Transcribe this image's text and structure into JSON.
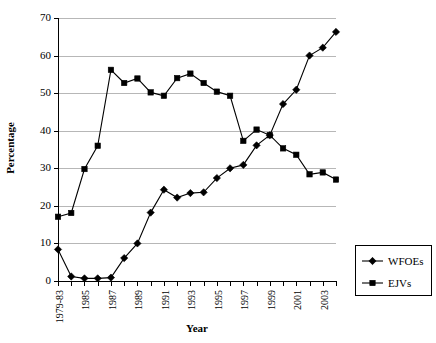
{
  "chart_data": {
    "type": "line",
    "title": "",
    "xlabel": "Year",
    "ylabel": "Percentage",
    "ylim": [
      0,
      70
    ],
    "ytick_step": 10,
    "yticks": [
      0,
      10,
      20,
      30,
      40,
      50,
      60,
      70
    ],
    "grid": true,
    "legend_position": "right",
    "x": [
      "1979-83",
      "1984",
      "1985",
      "1986",
      "1987",
      "1988",
      "1989",
      "1990",
      "1991",
      "1992",
      "1993",
      "1994",
      "1995",
      "1996",
      "1997",
      "1998",
      "1999",
      "2000",
      "2001",
      "2002",
      "2003",
      "2004"
    ],
    "xtick_labels_shown": [
      "1979-83",
      "",
      "1985",
      "",
      "1987",
      "",
      "1989",
      "",
      "1991",
      "",
      "1993",
      "",
      "1995",
      "",
      "1997",
      "",
      "1999",
      "",
      "2001",
      "",
      "2003",
      ""
    ],
    "series": [
      {
        "name": "WFOEs",
        "marker": "diamond",
        "values": [
          8.4,
          1.2,
          0.7,
          0.7,
          0.9,
          6.1,
          10.0,
          18.2,
          24.3,
          22.2,
          23.4,
          23.6,
          27.4,
          30.0,
          30.9,
          36.1,
          38.8,
          47.1,
          50.9,
          60.0,
          62.1,
          66.3
        ]
      },
      {
        "name": "EJVs",
        "marker": "square",
        "values": [
          17.1,
          18.1,
          29.8,
          36.0,
          56.2,
          52.7,
          53.9,
          50.2,
          49.3,
          54.0,
          55.2,
          52.7,
          50.4,
          49.3,
          37.3,
          40.3,
          38.8,
          35.3,
          33.6,
          28.4,
          28.9,
          27.0
        ]
      }
    ]
  },
  "legend": {
    "items": [
      {
        "label": "WFOEs",
        "marker": "diamond"
      },
      {
        "label": "EJVs",
        "marker": "square"
      }
    ]
  },
  "colors": {
    "line": "#000000",
    "grid": "#b7b7b7",
    "axis": "#000000",
    "background": "#ffffff"
  }
}
